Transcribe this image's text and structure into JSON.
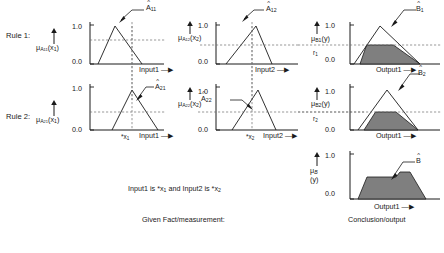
{
  "figure": {
    "rules": [
      {
        "id": "rule1",
        "label": "Rule 1:",
        "firing_level_label": "r",
        "firing_level_sub": "1",
        "antecedents": [
          {
            "id": "rule1-antecedent1",
            "y_axis_label_mu": "μ",
            "y_axis_label_sub": "A",
            "y_axis_label_sub2": "11",
            "y_axis_label_arg": "(x",
            "y_axis_label_arg_sub": "1",
            "y_axis_label_arg_close": ")",
            "y_top": "1.0",
            "y_bottom": "0.0",
            "x_axis_label": "Input1",
            "x_axis_arrow": "—▶",
            "set_label": "A",
            "set_label_sub": "11",
            "set_hat": true,
            "membership_at_input": 0.62,
            "triangle": {
              "left": 0.1,
              "peak": 0.33,
              "right": 0.72
            }
          },
          {
            "id": "rule1-antecedent2",
            "y_axis_label_mu": "μ",
            "y_axis_label_sub": "A",
            "y_axis_label_sub2": "12",
            "y_axis_label_arg": "(x",
            "y_axis_label_arg_sub": "2",
            "y_axis_label_arg_close": ")",
            "y_top": "1.0",
            "y_bottom": "0.0",
            "x_axis_label": "Input2",
            "x_axis_arrow": "—▶",
            "set_label": "A",
            "set_label_sub": "12",
            "set_hat": true,
            "membership_at_input": 0.5,
            "triangle": {
              "left": 0.08,
              "peak": 0.55,
              "right": 0.78
            }
          }
        ],
        "consequent": {
          "id": "rule1-consequent",
          "y_axis_label_mu": "μ",
          "y_axis_label_sub": "B1",
          "y_axis_label_arg": "(y)",
          "y_top": "1.0",
          "y_bottom": "0.0",
          "x_axis_label": "Output1",
          "x_axis_arrow": "—▶",
          "set_label": "B",
          "set_label_sub": "1",
          "set_hat": true,
          "clip_level": 0.5,
          "triangle": {
            "left": 0.06,
            "peak": 0.42,
            "right": 0.88
          }
        }
      },
      {
        "id": "rule2",
        "label": "Rule 2:",
        "firing_level_label": "r",
        "firing_level_sub": "2",
        "antecedents": [
          {
            "id": "rule2-antecedent1",
            "y_axis_label_mu": "μ",
            "y_axis_label_sub": "A",
            "y_axis_label_sub2": "21",
            "y_axis_label_arg": "(x",
            "y_axis_label_arg_sub": "1",
            "y_axis_label_arg_close": ")",
            "y_top": "1.0",
            "y_bottom": "0.0",
            "x_axis_label": "Input1",
            "x_axis_arrow": "—▶",
            "x_input_marker": "*x",
            "x_input_marker_sub": "1",
            "set_label": "A",
            "set_label_sub": "21",
            "set_hat": true,
            "membership_at_input": 0.42,
            "triangle": {
              "left": 0.3,
              "peak": 0.6,
              "right": 0.92
            }
          },
          {
            "id": "rule2-antecedent2",
            "y_axis_label_mu": "μ",
            "y_axis_label_sub": "A",
            "y_axis_label_sub2": "22",
            "y_axis_label_arg": "(x",
            "y_axis_label_arg_sub": "2",
            "y_axis_label_arg_close": ")",
            "y_top": "1.0",
            "y_bottom": "0.0",
            "x_axis_label": "Input2",
            "x_axis_arrow": "—▶",
            "x_input_marker": "*x",
            "x_input_marker_sub": "2",
            "set_label": "A",
            "set_label_sub": "22",
            "set_hat": true,
            "membership_at_input": 0.42,
            "triangle": {
              "left": 0.22,
              "peak": 0.64,
              "right": 0.9
            }
          }
        ],
        "consequent": {
          "id": "rule2-consequent",
          "y_axis_label_mu": "μ",
          "y_axis_label_sub": "B2",
          "y_axis_label_arg": "(y)",
          "y_top": "1.0",
          "y_bottom": "0.0",
          "x_axis_label": "Output1",
          "x_axis_arrow": "—▶",
          "set_label": "B",
          "set_label_sub": "2",
          "set_hat": true,
          "clip_level": 0.42,
          "triangle": {
            "left": 0.1,
            "peak": 0.52,
            "right": 0.92
          }
        }
      }
    ],
    "conclusion": {
      "id": "conclusion-chart",
      "y_axis_label_mu": "μ",
      "y_axis_label_sub": "B",
      "y_axis_label_arg": "(y)",
      "y_top": "1.0",
      "y_bottom": "0.0",
      "x_axis_label": "Output1",
      "x_axis_arrow": "—▶",
      "caption": "Conclusion/output",
      "set_label": "B",
      "set_hat": true,
      "aggregate_levels": [
        0.5,
        0.62
      ]
    },
    "fact": {
      "statement": "Input1 is *x₁ and Input2 is *x₂",
      "statement_parts": {
        "prefix": "Input1 is *x",
        "sub1": "1",
        "middle": " and Input2 is *x",
        "sub2": "2"
      },
      "caption": "Given Fact/measurement:"
    },
    "colors": {
      "ink": "#1a1a1a",
      "fill_gray": "#7f7f7f",
      "dashed_guide": "#6e6e6e",
      "background": "#ffffff"
    }
  }
}
